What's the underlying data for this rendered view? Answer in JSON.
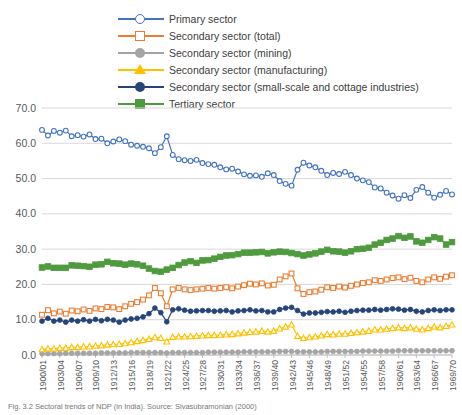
{
  "chart_data": {
    "type": "line",
    "title": "",
    "xlabel": "",
    "ylabel": "",
    "ylim": [
      0,
      70
    ],
    "yticks": [
      "0.0",
      "10.0",
      "20.0",
      "30.0",
      "40.0",
      "50.0",
      "60.0",
      "70.0"
    ],
    "grid": true,
    "legend_position": "top",
    "categories": [
      "1900/01",
      "1901/02",
      "1902/03",
      "1903/04",
      "1904/05",
      "1905/06",
      "1906/07",
      "1907/08",
      "1908/09",
      "1909/10",
      "1910/11",
      "1911/12",
      "1912/13",
      "1913/14",
      "1914/15",
      "1915/16",
      "1916/17",
      "1917/18",
      "1918/19",
      "1919/20",
      "1920/21",
      "1921/22",
      "1922/23",
      "1923/24",
      "1924/25",
      "1925/26",
      "1926/27",
      "1927/28",
      "1928/29",
      "1929/30",
      "1930/31",
      "1931/32",
      "1932/33",
      "1933/34",
      "1934/35",
      "1935/36",
      "1936/37",
      "1937/38",
      "1938/39",
      "1939/40",
      "1940/41",
      "1941/42",
      "1942/43",
      "1943/44",
      "1944/45",
      "1945/46",
      "1946/47",
      "1947/48",
      "1948/49",
      "1949/50",
      "1950/51",
      "1951/52",
      "1952/53",
      "1953/54",
      "1954/55",
      "1955/56",
      "1956/57",
      "1957/58",
      "1958/59",
      "1959/60",
      "1960/61",
      "1961/62",
      "1962/63",
      "1963/64",
      "1964/65",
      "1965/66",
      "1966/67",
      "1967/68",
      "1968/69",
      "1969/70"
    ],
    "xtick_labels": [
      "1900/01",
      "1903/04",
      "1906/07",
      "1909/10",
      "1912/13",
      "1915/16",
      "1918/19",
      "1921/22",
      "1924/25",
      "1927/28",
      "1930/31",
      "1933/34",
      "1936/37",
      "1939/40",
      "1942/43",
      "1945/46",
      "1948/49",
      "1951/52",
      "1954/55",
      "1957/58",
      "1960/61",
      "1963/64",
      "1966/67",
      "1969/70"
    ],
    "series": [
      {
        "name": "Primary sector",
        "color": "#4472C4",
        "marker": "circle-open",
        "values": [
          63.8,
          62.2,
          63.5,
          63.0,
          63.6,
          62.0,
          62.3,
          61.9,
          62.5,
          61.2,
          61.3,
          60.0,
          60.5,
          61.1,
          60.6,
          59.6,
          59.3,
          59.0,
          58.6,
          57.2,
          58.9,
          62.0,
          56.7,
          55.5,
          55.2,
          55.0,
          55.3,
          54.4,
          54.1,
          53.9,
          53.2,
          52.6,
          52.8,
          52.0,
          51.2,
          50.8,
          50.9,
          50.5,
          51.5,
          51.0,
          49.3,
          48.5,
          48.0,
          52.5,
          54.5,
          53.7,
          53.2,
          52.2,
          51.0,
          51.6,
          51.3,
          51.9,
          51.0,
          50.0,
          49.5,
          49.0,
          47.5,
          47.2,
          46.0,
          45.2,
          44.3,
          45.3,
          44.5,
          46.8,
          47.6,
          46.0,
          44.6,
          45.4,
          46.5,
          45.5
        ]
      },
      {
        "name": "Secondary sector (total)",
        "color": "#ED7D31",
        "marker": "square-open",
        "values": [
          11.4,
          12.7,
          11.8,
          12.3,
          11.7,
          12.6,
          12.4,
          12.9,
          12.5,
          13.2,
          13.0,
          13.6,
          13.5,
          13.0,
          13.8,
          14.5,
          15.0,
          15.7,
          16.9,
          19.0,
          17.5,
          13.8,
          18.6,
          19.0,
          18.6,
          18.4,
          18.6,
          18.8,
          19.0,
          18.8,
          19.0,
          19.2,
          18.9,
          19.4,
          19.8,
          20.2,
          20.0,
          20.3,
          19.7,
          19.9,
          21.4,
          22.3,
          23.1,
          18.9,
          17.3,
          17.8,
          18.0,
          18.5,
          19.2,
          19.0,
          19.4,
          19.1,
          19.6,
          20.0,
          20.4,
          20.6,
          21.2,
          21.0,
          21.4,
          21.8,
          22.0,
          21.5,
          21.9,
          21.0,
          20.6,
          21.4,
          22.0,
          21.6,
          22.2,
          22.6
        ]
      },
      {
        "name": "Secondary sector (mining)",
        "color": "#A5A5A5",
        "marker": "circle-filled",
        "values": [
          0.4,
          0.4,
          0.4,
          0.4,
          0.5,
          0.5,
          0.5,
          0.5,
          0.5,
          0.5,
          0.6,
          0.6,
          0.6,
          0.6,
          0.6,
          0.7,
          0.7,
          0.7,
          0.7,
          0.7,
          0.7,
          0.6,
          0.7,
          0.7,
          0.7,
          0.7,
          0.7,
          0.7,
          0.8,
          0.8,
          0.8,
          0.8,
          0.8,
          0.8,
          0.9,
          0.9,
          0.9,
          0.9,
          0.9,
          0.9,
          1.0,
          1.0,
          1.0,
          0.9,
          0.9,
          0.9,
          0.9,
          0.9,
          1.0,
          1.0,
          1.0,
          1.0,
          1.0,
          1.0,
          1.1,
          1.1,
          1.1,
          1.1,
          1.1,
          1.1,
          1.2,
          1.2,
          1.2,
          1.2,
          1.2,
          1.2,
          1.2,
          1.2,
          1.2,
          1.2
        ]
      },
      {
        "name": "Secondary sector (manufacturing)",
        "color": "#FFC000",
        "marker": "triangle-open",
        "values": [
          1.6,
          1.8,
          1.8,
          2.0,
          2.0,
          2.2,
          2.2,
          2.4,
          2.4,
          2.6,
          2.7,
          2.9,
          3.0,
          3.1,
          3.3,
          3.6,
          3.9,
          4.2,
          4.5,
          5.0,
          4.8,
          3.8,
          5.1,
          5.2,
          5.2,
          5.3,
          5.4,
          5.5,
          5.6,
          5.6,
          5.7,
          5.8,
          5.9,
          6.1,
          6.3,
          6.5,
          6.6,
          6.8,
          6.6,
          6.8,
          7.5,
          8.0,
          8.6,
          5.4,
          4.8,
          5.0,
          5.2,
          5.5,
          5.9,
          5.8,
          6.0,
          6.0,
          6.2,
          6.4,
          6.6,
          6.8,
          7.2,
          7.2,
          7.4,
          7.6,
          7.8,
          7.6,
          7.8,
          7.4,
          7.2,
          7.6,
          8.0,
          7.8,
          8.2,
          8.6
        ]
      },
      {
        "name": "Secondary sector (small-scale and cottage industries)",
        "color": "#264478",
        "marker": "circle-filled",
        "values": [
          9.6,
          10.4,
          9.6,
          9.9,
          9.3,
          9.9,
          9.6,
          10.0,
          9.6,
          10.1,
          9.7,
          10.1,
          9.9,
          9.3,
          9.9,
          10.2,
          10.4,
          10.8,
          11.7,
          13.3,
          12.0,
          9.4,
          12.8,
          13.1,
          12.7,
          12.4,
          12.5,
          12.6,
          12.6,
          12.4,
          12.5,
          12.6,
          12.2,
          12.5,
          12.6,
          12.8,
          12.5,
          12.6,
          12.2,
          12.2,
          12.9,
          13.3,
          13.5,
          12.6,
          11.6,
          11.9,
          11.9,
          12.1,
          12.3,
          12.2,
          12.4,
          12.1,
          12.4,
          12.6,
          12.7,
          12.7,
          12.9,
          12.7,
          12.9,
          13.1,
          13.0,
          12.7,
          12.9,
          12.4,
          12.2,
          12.6,
          12.8,
          12.6,
          12.8,
          12.8
        ]
      },
      {
        "name": "Tertiary sector",
        "color": "#4E9A3E",
        "marker": "square-filled",
        "values": [
          24.8,
          25.1,
          24.7,
          24.7,
          24.7,
          25.4,
          25.3,
          25.2,
          25.0,
          25.6,
          25.7,
          26.4,
          26.0,
          25.9,
          25.6,
          25.9,
          25.7,
          25.3,
          24.5,
          23.8,
          23.6,
          24.2,
          24.7,
          25.5,
          26.2,
          26.6,
          26.1,
          26.8,
          26.9,
          27.3,
          27.8,
          28.2,
          28.3,
          28.6,
          29.0,
          29.0,
          29.1,
          29.2,
          28.8,
          29.1,
          29.3,
          29.2,
          28.9,
          28.6,
          28.2,
          28.5,
          28.8,
          29.3,
          29.8,
          29.4,
          29.3,
          29.0,
          29.4,
          30.0,
          30.1,
          30.4,
          31.3,
          31.8,
          32.6,
          33.0,
          33.7,
          33.2,
          33.6,
          32.2,
          31.8,
          32.6,
          33.4,
          33.0,
          31.3,
          32.0
        ]
      }
    ]
  },
  "legend": {
    "items": [
      {
        "label": "Primary sector"
      },
      {
        "label": "Secondary sector (total)"
      },
      {
        "label": "Secondary sector (mining)"
      },
      {
        "label": "Secondary sector (manufacturing)"
      },
      {
        "label": "Secondary sector (small-scale and cottage industries)"
      },
      {
        "label": "Tertiary sector"
      }
    ]
  },
  "caption": {
    "text": "Fig. 3.2 Sectoral trends of NDP (in India). Source: Sivasubramonian (2000)"
  }
}
